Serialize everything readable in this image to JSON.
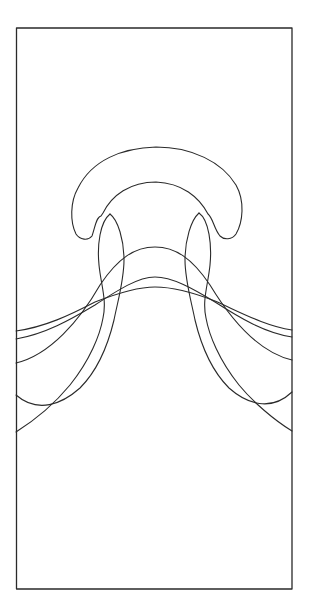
{
  "figure": {
    "type": "line-drawing",
    "stroke_color": "#2a2a2a",
    "background": "#ffffff",
    "frame": {
      "x": 16,
      "y": 28,
      "width": 276,
      "height": 561
    },
    "contours": [
      {
        "name": "cap-outline",
        "kind": "closed-lobe"
      },
      {
        "name": "stem-left-lobe",
        "kind": "closed-lobe"
      },
      {
        "name": "stem-right-lobe",
        "kind": "closed-lobe"
      },
      {
        "name": "arch-outer",
        "left_edge_y": 432,
        "right_edge_y": 431
      },
      {
        "name": "arch-2",
        "left_edge_y": 395,
        "right_edge_y": 392,
        "peak_y": 182
      },
      {
        "name": "arch-3",
        "left_edge_y": 363,
        "right_edge_y": 360,
        "peak_y": 247
      },
      {
        "name": "arch-4",
        "left_edge_y": 339,
        "right_edge_y": 337,
        "peak_y": 277
      },
      {
        "name": "arch-5",
        "left_edge_y": 331,
        "right_edge_y": 330,
        "peak_y": 287
      }
    ]
  }
}
